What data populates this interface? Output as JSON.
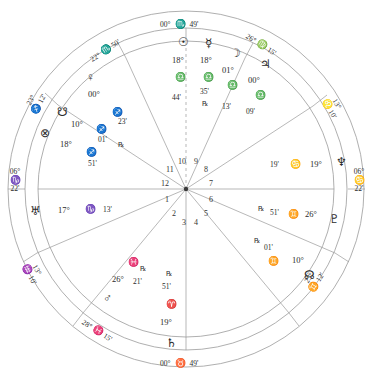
{
  "chart": {
    "type": "natal-wheel",
    "rings": {
      "outer_radius": 180,
      "zodiac_band_inner": 163,
      "house_band_inner": 150,
      "center_x": 186,
      "center_y": 189
    },
    "angles": {
      "mc": {
        "label_deg": "00°",
        "sign": "♏",
        "label_min": "49'",
        "name": "Midheaven"
      },
      "ic": {
        "label_deg": "00°",
        "sign": "♉",
        "label_min": "49'",
        "name": "Imum Coeli"
      },
      "asc": {
        "label_deg": "06°",
        "sign": "♑",
        "label_min": "22'",
        "name": "Ascendant"
      },
      "dsc": {
        "label_deg": "06°",
        "sign": "♋",
        "label_min": "22'",
        "name": "Descendant"
      }
    },
    "house_cusps": [
      {
        "house": 11,
        "deg": "22°",
        "sign": "♏",
        "min": "50'"
      },
      {
        "house": 12,
        "deg": "23°",
        "sign": "♐",
        "min": "12'"
      },
      {
        "house": 2,
        "deg": "13°",
        "sign": "♒",
        "min": "10'"
      },
      {
        "house": 3,
        "deg": "28°",
        "sign": "♓",
        "min": "15'"
      },
      {
        "house": 5,
        "deg": "23°",
        "sign": "♊",
        "min": "12'"
      },
      {
        "house": 6,
        "deg": "13°",
        "sign": "♌",
        "min": "10'"
      },
      {
        "house": 9,
        "deg": "26°",
        "sign": "♍",
        "min": "15'"
      }
    ],
    "house_numbers": [
      "1",
      "2",
      "3",
      "4",
      "5",
      "6",
      "7",
      "8",
      "9",
      "10",
      "11",
      "12"
    ],
    "planets": [
      {
        "name": "sun",
        "glyph": "☉",
        "deg": "18°",
        "sign": "♎",
        "min": "44'",
        "retro": ""
      },
      {
        "name": "mercury",
        "glyph": "☿",
        "deg": "18°",
        "sign": "♎",
        "min": "35'",
        "retro": "℞"
      },
      {
        "name": "moon",
        "glyph": "☽",
        "deg": "01°",
        "sign": "♎",
        "min": "13'",
        "retro": ""
      },
      {
        "name": "jupiter",
        "glyph": "♃",
        "deg": "00°",
        "sign": "♎",
        "min": "09'",
        "retro": ""
      },
      {
        "name": "venus",
        "glyph": "♀",
        "deg": "00°",
        "sign": "♐",
        "min": "23'",
        "retro": ""
      },
      {
        "name": "south-node",
        "glyph": "☋",
        "deg": "10°",
        "sign": "♐",
        "min": "01'",
        "retro": "℞"
      },
      {
        "name": "fortune",
        "glyph": "⊗",
        "deg": "18°",
        "sign": "♐",
        "min": "51'",
        "retro": ""
      },
      {
        "name": "uranus",
        "glyph": "♅",
        "deg": "17°",
        "sign": "♑",
        "min": "13'",
        "retro": ""
      },
      {
        "name": "mars",
        "glyph": "♂",
        "deg": "26°",
        "sign": "♓",
        "min": "21'",
        "retro": "℞"
      },
      {
        "name": "saturn",
        "glyph": "♄",
        "deg": "19°",
        "sign": "♈",
        "min": "51'",
        "retro": "℞"
      },
      {
        "name": "north-node",
        "glyph": "☊",
        "deg": "10°",
        "sign": "♊",
        "min": "01'",
        "retro": "℞"
      },
      {
        "name": "pluto",
        "glyph": "♇",
        "deg": "26°",
        "sign": "♊",
        "min": "51'",
        "retro": "℞"
      },
      {
        "name": "neptune",
        "glyph": "♆",
        "deg": "19°",
        "sign": "♋",
        "min": "19'",
        "retro": ""
      }
    ],
    "colors": {
      "line": "#9a9a9a",
      "line_strong": "#6e6e6e",
      "text": "#2a2a2a"
    }
  }
}
